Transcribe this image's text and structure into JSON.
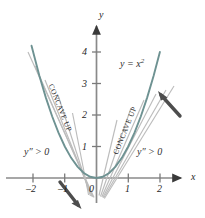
{
  "figure": {
    "name": "concavity-of-parabola-figure",
    "curve_label": "y = x",
    "curve_label_exponent": "2",
    "axis_x_label": "x",
    "axis_y_label": "y",
    "concave_left_text": "CONCAVE UP",
    "concave_right_text": "CONCAVE UP",
    "second_deriv_left": "y″ > 0",
    "second_deriv_right": "y″ > 0",
    "colors": {
      "curve": "#6b8e8e",
      "tangent": "#b9b9b9",
      "axis": "#8a8a8a",
      "text": "#1f1f1f",
      "arrow": "#4a4a4a"
    }
  },
  "chart_data": {
    "type": "line",
    "title": "",
    "subtitle": "",
    "xlabel": "x",
    "ylabel": "y",
    "function": "y = x^2",
    "xlim": [
      -2.6,
      2.6
    ],
    "ylim": [
      -0.9,
      4.6
    ],
    "grid": false,
    "legend": null,
    "x_ticks": [
      -2,
      -1,
      0,
      1,
      2
    ],
    "x_tick_labels": [
      "–2",
      "–1",
      "0",
      "1",
      "2"
    ],
    "y_ticks": [
      1,
      2,
      3,
      4
    ],
    "y_tick_labels": [
      "1",
      "2",
      "3",
      "4"
    ],
    "series": [
      {
        "name": "y = x^2",
        "x": [
          -2.05,
          -1.8,
          -1.6,
          -1.4,
          -1.2,
          -1.0,
          -0.8,
          -0.6,
          -0.4,
          -0.2,
          0.0,
          0.2,
          0.4,
          0.6,
          0.8,
          1.0,
          1.2,
          1.4,
          1.6,
          1.8,
          2.0
        ],
        "values": [
          4.2,
          3.24,
          2.56,
          1.96,
          1.44,
          1.0,
          0.64,
          0.36,
          0.16,
          0.04,
          0.0,
          0.04,
          0.16,
          0.36,
          0.64,
          1.0,
          1.44,
          1.96,
          2.56,
          3.24,
          4.0
        ]
      }
    ],
    "tangent_lines": {
      "description": "Family of tangent lines to y = x^2 drawn at several points, fanning out on both branches to show increasing slope",
      "tangent_points_right": [
        0.2,
        0.45,
        0.7,
        0.95,
        1.2,
        1.45
      ],
      "tangent_points_left": [
        -0.25,
        -0.55,
        -0.85,
        -1.15,
        -1.45
      ],
      "slope_formula": "y' = 2x"
    },
    "annotations": [
      {
        "text": "y = x²",
        "x": 1.25,
        "y": 3.6,
        "name": "curve-equation"
      },
      {
        "text": "CONCAVE UP",
        "x": -1.05,
        "y": 2.0,
        "name": "concave-up-left",
        "rotation": 68
      },
      {
        "text": "CONCAVE UP",
        "x": 1.0,
        "y": 1.85,
        "name": "concave-up-right",
        "rotation": -68
      },
      {
        "text": "y″ > 0",
        "x": -1.7,
        "y": 0.95,
        "name": "second-derivative-left"
      },
      {
        "text": "y″ > 0",
        "x": 1.45,
        "y": 0.95,
        "name": "second-derivative-right"
      }
    ],
    "direction_arrows": [
      {
        "name": "upper-right-arrow",
        "from": [
          2.55,
          3.05
        ],
        "to": [
          1.95,
          3.75
        ],
        "note": "points up-left toward curve"
      },
      {
        "name": "lower-left-arrow",
        "from": [
          -1.15,
          -0.25
        ],
        "to": [
          -0.72,
          -0.75
        ],
        "note": "points down-right away from curve"
      }
    ]
  }
}
